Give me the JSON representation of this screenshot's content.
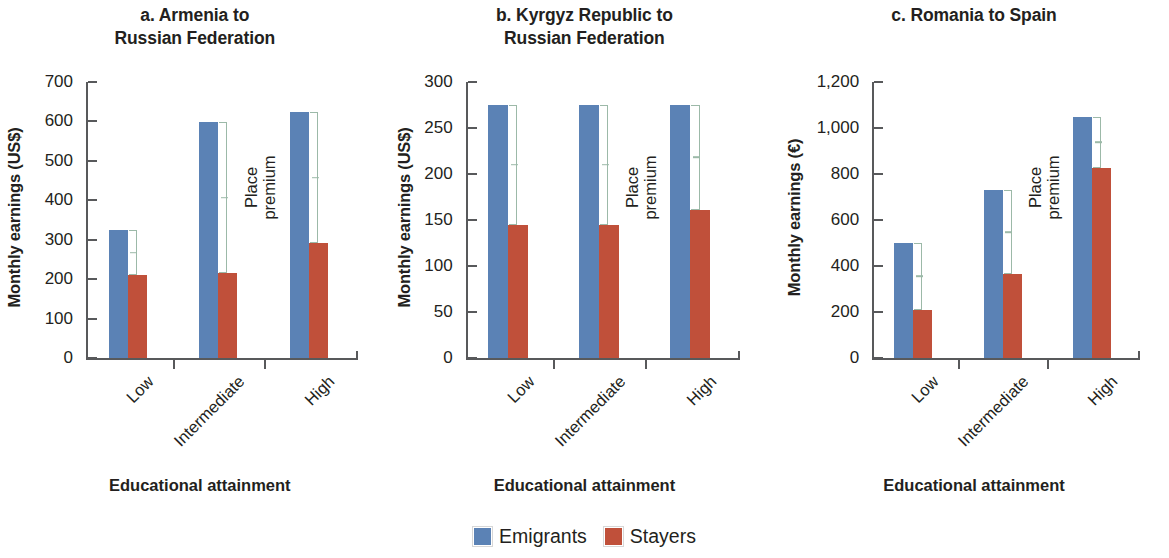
{
  "figure": {
    "xaxis_title": "Educational attainment",
    "premium_label_line1": "Place",
    "premium_label_line2": "premium",
    "legend": [
      {
        "label": "Emigrants",
        "color": "#5b82b5"
      },
      {
        "label": "Stayers",
        "color": "#c0503a"
      }
    ]
  },
  "chart_data": [
    {
      "type": "bar",
      "title": "a. Armenia to Russian Federation",
      "title_lines": [
        "a. Armenia to",
        "Russian Federation"
      ],
      "xlabel": "Educational attainment",
      "ylabel": "Monthly earnings (US$)",
      "categories": [
        "Low",
        "Intermediate",
        "High"
      ],
      "ylim": [
        0,
        700
      ],
      "yticks": [
        0,
        100,
        200,
        300,
        400,
        500,
        600,
        700
      ],
      "ytick_labels": [
        "0",
        "100",
        "200",
        "300",
        "400",
        "500",
        "600",
        "700"
      ],
      "grid": false,
      "legend_position": "bottom-center",
      "series": [
        {
          "name": "Emigrants",
          "color": "#5b82b5",
          "values": [
            325,
            598,
            623
          ]
        },
        {
          "name": "Stayers",
          "color": "#c0503a",
          "values": [
            210,
            215,
            291
          ]
        }
      ],
      "annotations": [
        {
          "text": "Place premium",
          "type": "bracket-label",
          "between": [
            "Emigrants",
            "Stayers"
          ]
        }
      ]
    },
    {
      "type": "bar",
      "title": "b. Kyrgyz Republic to Russian Federation",
      "title_lines": [
        "b. Kyrgyz Republic to",
        "Russian Federation"
      ],
      "xlabel": "Educational attainment",
      "ylabel": "Monthly earnings (US$)",
      "categories": [
        "Low",
        "Intermediate",
        "High"
      ],
      "ylim": [
        0,
        300
      ],
      "yticks": [
        0,
        50,
        100,
        150,
        200,
        250,
        300
      ],
      "ytick_labels": [
        "0",
        "50",
        "100",
        "150",
        "200",
        "250",
        "300"
      ],
      "grid": false,
      "legend_position": "bottom-center",
      "series": [
        {
          "name": "Emigrants",
          "color": "#5b82b5",
          "values": [
            275,
            275,
            275
          ]
        },
        {
          "name": "Stayers",
          "color": "#c0503a",
          "values": [
            145,
            145,
            161
          ]
        }
      ],
      "annotations": [
        {
          "text": "Place premium",
          "type": "bracket-label",
          "between": [
            "Emigrants",
            "Stayers"
          ]
        }
      ]
    },
    {
      "type": "bar",
      "title": "c. Romania to Spain",
      "title_lines": [
        "c. Romania to Spain"
      ],
      "xlabel": "Educational attainment",
      "ylabel": "Monthly earnings (€)",
      "categories": [
        "Low",
        "Intermediate",
        "High"
      ],
      "ylim": [
        0,
        1200
      ],
      "yticks": [
        0,
        200,
        400,
        600,
        800,
        1000,
        1200
      ],
      "ytick_labels": [
        "0",
        "200",
        "400",
        "600",
        "800",
        "1,000",
        "1,200"
      ],
      "grid": false,
      "legend_position": "bottom-center",
      "series": [
        {
          "name": "Emigrants",
          "color": "#5b82b5",
          "values": [
            500,
            730,
            1050
          ]
        },
        {
          "name": "Stayers",
          "color": "#c0503a",
          "values": [
            210,
            365,
            825
          ]
        }
      ],
      "annotations": [
        {
          "text": "Place premium",
          "type": "bracket-label",
          "between": [
            "Emigrants",
            "Stayers"
          ]
        }
      ]
    }
  ]
}
